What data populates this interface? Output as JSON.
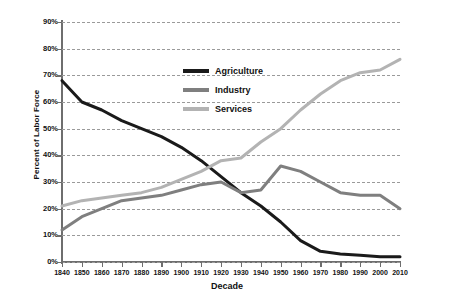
{
  "chart_data": {
    "type": "line",
    "title": "",
    "xlabel": "Decade",
    "ylabel": "Percent of Labor Force",
    "xlim": [
      1840,
      2010
    ],
    "ylim": [
      0,
      90
    ],
    "grid": true,
    "legend_position": "upper-center",
    "categories": [
      1840,
      1850,
      1860,
      1870,
      1880,
      1890,
      1900,
      1910,
      1920,
      1930,
      1940,
      1950,
      1960,
      1970,
      1980,
      1990,
      2000,
      2010
    ],
    "x_tick_labels": [
      "1840",
      "1850",
      "1860",
      "1870",
      "1880",
      "1890",
      "1900",
      "1910",
      "1920",
      "1930",
      "1940",
      "1950",
      "1960",
      "1970",
      "1980",
      "1990",
      "2000",
      "2010"
    ],
    "y_tick_labels": [
      "0%",
      "10%",
      "20%",
      "30%",
      "40%",
      "50%",
      "60%",
      "70%",
      "80%",
      "90%"
    ],
    "y_tick_values": [
      0,
      10,
      20,
      30,
      40,
      50,
      60,
      70,
      80,
      90
    ],
    "series": [
      {
        "name": "Agriculture",
        "color": "#1a1a1a",
        "values": [
          68,
          60,
          57,
          53,
          50,
          47,
          43,
          38,
          32,
          26,
          21,
          15,
          8,
          4,
          3,
          2.5,
          2,
          2
        ]
      },
      {
        "name": "Industry",
        "color": "#7f7f7f",
        "values": [
          12,
          17,
          20,
          23,
          24,
          25,
          27,
          29,
          30,
          26,
          27,
          36,
          34,
          30,
          26,
          25,
          25,
          20
        ]
      },
      {
        "name": "Services",
        "color": "#b3b3b3",
        "values": [
          21,
          23,
          24,
          25,
          26,
          28,
          31,
          34,
          38,
          39,
          45,
          50,
          57,
          63,
          68,
          71,
          72,
          76
        ]
      }
    ]
  },
  "legend": {
    "items": [
      {
        "label": "Agriculture",
        "color": "#1a1a1a"
      },
      {
        "label": "Industry",
        "color": "#7f7f7f"
      },
      {
        "label": "Services",
        "color": "#b3b3b3"
      }
    ]
  }
}
